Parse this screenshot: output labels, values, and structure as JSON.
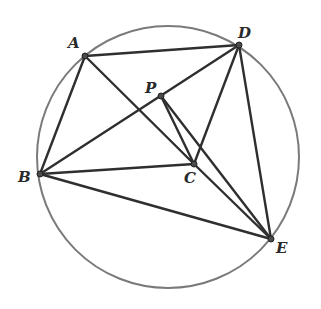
{
  "diagram": {
    "type": "geometry",
    "circle": {
      "cx": 168,
      "cy": 157,
      "r": 131,
      "color": "#7a7a7a"
    },
    "points": {
      "A": {
        "label": "A",
        "x": 85,
        "y": 56,
        "lx": 68,
        "ly": 48
      },
      "D": {
        "label": "D",
        "x": 239,
        "y": 45,
        "lx": 238,
        "ly": 38
      },
      "P": {
        "label": "P",
        "x": 161,
        "y": 96,
        "lx": 145,
        "ly": 93
      },
      "B": {
        "label": "B",
        "x": 40,
        "y": 174,
        "lx": 18,
        "ly": 182
      },
      "C": {
        "label": "C",
        "x": 194,
        "y": 164,
        "lx": 184,
        "ly": 183
      },
      "E": {
        "label": "E",
        "x": 271,
        "y": 239,
        "lx": 276,
        "ly": 253
      }
    },
    "segments": [
      [
        "A",
        "D"
      ],
      [
        "A",
        "B"
      ],
      [
        "A",
        "C"
      ],
      [
        "B",
        "D"
      ],
      [
        "B",
        "C"
      ],
      [
        "B",
        "E"
      ],
      [
        "D",
        "C"
      ],
      [
        "D",
        "E"
      ],
      [
        "P",
        "C"
      ],
      [
        "P",
        "E"
      ],
      [
        "C",
        "E"
      ]
    ],
    "line_color": "#2f2f2f"
  }
}
